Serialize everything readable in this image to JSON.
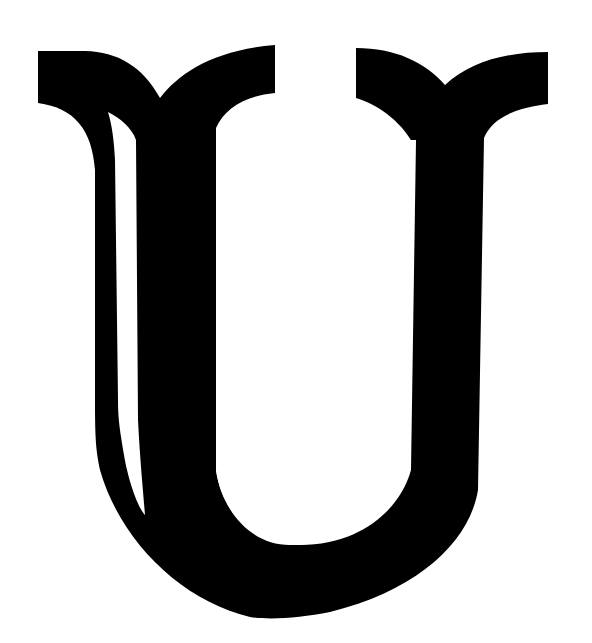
{
  "image": {
    "description": "Decorative serif capital letter glyph",
    "glyph": "U",
    "colors": {
      "background": "#ffffff",
      "ink": "#000000"
    }
  }
}
